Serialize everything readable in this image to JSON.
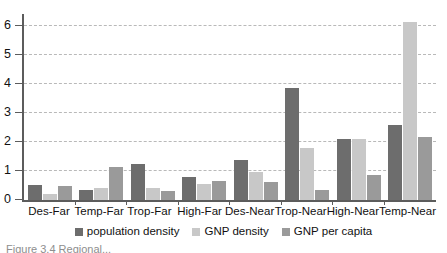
{
  "chart_data": {
    "type": "bar",
    "title": "",
    "subtitle": "",
    "xlabel": "",
    "ylabel": "",
    "ylim": [
      0,
      6.4
    ],
    "yticks": [
      0,
      1,
      2,
      3,
      4,
      5,
      6
    ],
    "ytick_labels": [
      "0",
      "1",
      "2",
      "3",
      "4",
      "5",
      "6"
    ],
    "grid": true,
    "grid_style": "dashed-horizontal",
    "legend_position": "bottom-center",
    "categories": [
      "Des-Far",
      "Temp-Far",
      "Trop-Far",
      "High-Far",
      "Des-Near",
      "Trop-Near",
      "High-Near",
      "Temp-Near"
    ],
    "series": [
      {
        "name": "population density",
        "color": "#6d6d6d",
        "values": [
          0.5,
          0.36,
          1.23,
          0.78,
          1.37,
          3.85,
          2.11,
          2.57
        ]
      },
      {
        "name": "GNP density",
        "color": "#c8c8c8",
        "values": [
          0.22,
          0.43,
          0.43,
          0.55,
          0.98,
          1.8,
          2.11,
          6.13
        ]
      },
      {
        "name": "GNP per capita",
        "color": "#9a9a9a",
        "values": [
          0.48,
          1.14,
          0.32,
          0.66,
          0.63,
          0.35,
          0.87,
          2.16
        ]
      }
    ]
  },
  "caption": {
    "text": "Figure 3.4  Regional..."
  }
}
